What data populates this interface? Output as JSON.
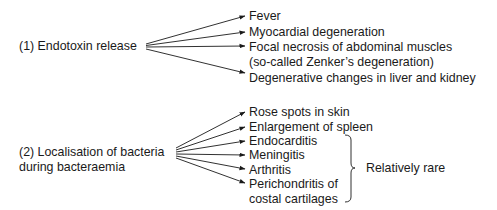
{
  "diagram": {
    "cause1": {
      "label": "(1) Endotoxin release",
      "effects": [
        "Fever",
        "Myocardial degeneration",
        "Focal necrosis of abdominal muscles",
        "Degenerative changes in liver and kidney"
      ],
      "effect3_continuation": "(so-called Zenker’s degeneration)"
    },
    "cause2": {
      "label_line1": "(2) Localisation of bacteria",
      "label_line2": "during bacteraemia",
      "effects": [
        "Rose spots in skin",
        "Enlargement of spleen",
        "Endocarditis",
        "Meningitis",
        "Arthritis",
        "Perichondritis of"
      ],
      "effect6_continuation": "costal cartilages",
      "bracket_note": "Relatively rare"
    },
    "colors": {
      "text": "#1a1a1a",
      "arrow": "#1a1a1a",
      "background": "#ffffff"
    }
  }
}
